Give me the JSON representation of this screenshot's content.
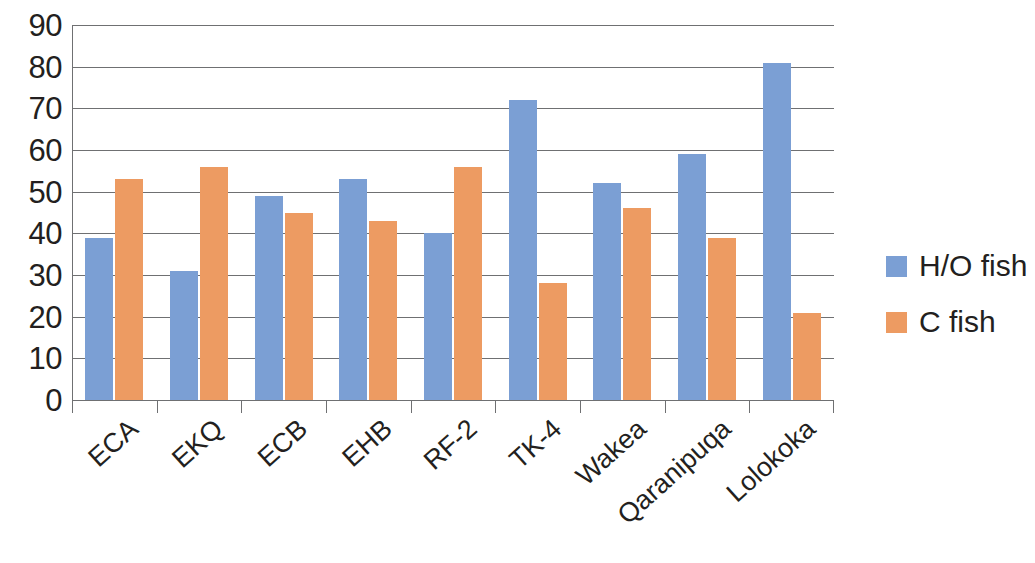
{
  "chart_data": {
    "type": "bar",
    "title": "",
    "subtitle": "",
    "xlabel": "",
    "ylabel": "",
    "ylim": [
      0,
      90
    ],
    "ytick_step": 10,
    "yticks": [
      90,
      80,
      70,
      60,
      50,
      40,
      30,
      20,
      10,
      0
    ],
    "grid": true,
    "legend_position": "right",
    "categories": [
      "ECA",
      "EKQ",
      "ECB",
      "EHB",
      "RF-2",
      "TK-4",
      "Wakea",
      "Qaranipuqa",
      "Lolokoka"
    ],
    "series": [
      {
        "name": "H/O fish",
        "color": "#7b9fd4",
        "values": [
          39,
          31,
          49,
          53,
          40,
          72,
          52,
          59,
          81
        ]
      },
      {
        "name": "C fish",
        "color": "#ed9b62",
        "values": [
          53,
          56,
          45,
          43,
          56,
          28,
          46,
          39,
          21
        ]
      }
    ]
  },
  "legend": {
    "items": [
      {
        "label": "H/O fish",
        "color": "#7b9fd4"
      },
      {
        "label": "C fish",
        "color": "#ed9b62"
      }
    ]
  },
  "axis": {
    "y_tick_labels": [
      "90",
      "80",
      "70",
      "60",
      "50",
      "40",
      "30",
      "20",
      "10",
      "0"
    ],
    "x_tick_labels": [
      "ECA",
      "EKQ",
      "ECB",
      "EHB",
      "RF-2",
      "TK-4",
      "Wakea",
      "Qaranipuqa",
      "Lolokoka"
    ]
  },
  "colors": {
    "series_ho": "#7b9fd4",
    "series_c": "#ed9b62",
    "axis": "#6f7072",
    "text": "#231f20",
    "background": "#ffffff"
  }
}
